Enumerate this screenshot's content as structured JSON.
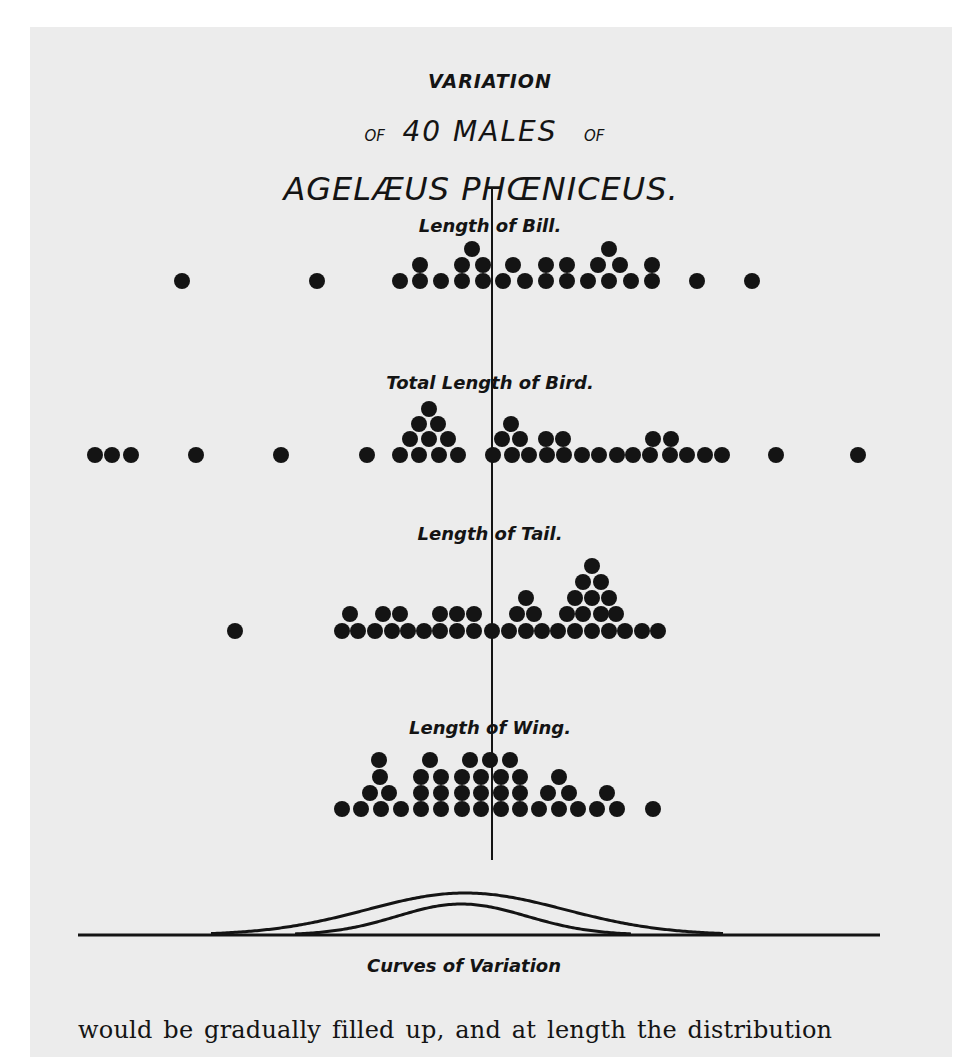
{
  "figure": {
    "title_line1": "VARIATION",
    "title_line2_prefix": "OF",
    "title_line2_main": "40 MALES",
    "title_line2_suffix": "OF",
    "title_line3": "AGELÆUS PHŒNICEUS.",
    "curves_caption": "Curves of Variation",
    "body_text": "would be gradually filled up, and at length the distribution",
    "colors": {
      "ink": "#141414",
      "paper": "#ececec",
      "background": "#ffffff"
    }
  },
  "chart_data": {
    "type": "scatter",
    "title": "Variation of 40 Males of Agelæus Phœniceus.",
    "mean_line": {
      "x": 492,
      "y_top": 188,
      "y_bottom": 860
    },
    "dot_radius": 8,
    "series": [
      {
        "name": "Length of Bill.",
        "label_pos": [
          492,
          232
        ],
        "count": 28,
        "dots": [
          [
            182,
            281
          ],
          [
            317,
            281
          ],
          [
            400,
            281
          ],
          [
            420,
            281
          ],
          [
            441,
            281
          ],
          [
            462,
            281
          ],
          [
            483,
            281
          ],
          [
            503,
            281
          ],
          [
            525,
            281
          ],
          [
            546,
            281
          ],
          [
            567,
            281
          ],
          [
            588,
            281
          ],
          [
            609,
            281
          ],
          [
            631,
            281
          ],
          [
            652,
            281
          ],
          [
            420,
            265
          ],
          [
            462,
            265
          ],
          [
            483,
            265
          ],
          [
            513,
            265
          ],
          [
            546,
            265
          ],
          [
            567,
            265
          ],
          [
            598,
            265
          ],
          [
            620,
            265
          ],
          [
            652,
            265
          ],
          [
            472,
            249
          ],
          [
            609,
            249
          ],
          [
            697,
            281
          ],
          [
            752,
            281
          ]
        ]
      },
      {
        "name": "Total Length of Bird.",
        "label_pos": [
          492,
          389
        ],
        "count": 39,
        "dots": [
          [
            95,
            455
          ],
          [
            112,
            455
          ],
          [
            131,
            455
          ],
          [
            196,
            455
          ],
          [
            281,
            455
          ],
          [
            367,
            455
          ],
          [
            400,
            455
          ],
          [
            419,
            455
          ],
          [
            439,
            455
          ],
          [
            458,
            455
          ],
          [
            410,
            439
          ],
          [
            429,
            439
          ],
          [
            448,
            439
          ],
          [
            419,
            424
          ],
          [
            438,
            424
          ],
          [
            429,
            409
          ],
          [
            493,
            455
          ],
          [
            512,
            455
          ],
          [
            529,
            455
          ],
          [
            547,
            455
          ],
          [
            564,
            455
          ],
          [
            582,
            455
          ],
          [
            599,
            455
          ],
          [
            617,
            455
          ],
          [
            633,
            455
          ],
          [
            650,
            455
          ],
          [
            670,
            455
          ],
          [
            687,
            455
          ],
          [
            705,
            455
          ],
          [
            722,
            455
          ],
          [
            502,
            439
          ],
          [
            520,
            439
          ],
          [
            546,
            439
          ],
          [
            563,
            439
          ],
          [
            653,
            439
          ],
          [
            671,
            439
          ],
          [
            511,
            424
          ],
          [
            776,
            455
          ],
          [
            858,
            455
          ]
        ]
      },
      {
        "name": "Length of Tail.",
        "label_pos": [
          492,
          540
        ],
        "count": 40,
        "dots": [
          [
            235,
            631
          ],
          [
            342,
            631
          ],
          [
            358,
            631
          ],
          [
            375,
            631
          ],
          [
            392,
            631
          ],
          [
            408,
            631
          ],
          [
            424,
            631
          ],
          [
            440,
            631
          ],
          [
            457,
            631
          ],
          [
            474,
            631
          ],
          [
            492,
            631
          ],
          [
            509,
            631
          ],
          [
            526,
            631
          ],
          [
            542,
            631
          ],
          [
            558,
            631
          ],
          [
            575,
            631
          ],
          [
            592,
            631
          ],
          [
            609,
            631
          ],
          [
            625,
            631
          ],
          [
            642,
            631
          ],
          [
            658,
            631
          ],
          [
            350,
            614
          ],
          [
            383,
            614
          ],
          [
            400,
            614
          ],
          [
            440,
            614
          ],
          [
            457,
            614
          ],
          [
            474,
            614
          ],
          [
            517,
            614
          ],
          [
            534,
            614
          ],
          [
            567,
            614
          ],
          [
            583,
            614
          ],
          [
            601,
            614
          ],
          [
            616,
            614
          ],
          [
            526,
            598
          ],
          [
            575,
            598
          ],
          [
            592,
            598
          ],
          [
            609,
            598
          ],
          [
            583,
            582
          ],
          [
            601,
            582
          ],
          [
            592,
            566
          ]
        ]
      },
      {
        "name": "Length of Wing.",
        "label_pos": [
          492,
          734
        ],
        "count": 40,
        "dots": [
          [
            342,
            809
          ],
          [
            361,
            809
          ],
          [
            381,
            809
          ],
          [
            401,
            809
          ],
          [
            421,
            809
          ],
          [
            441,
            809
          ],
          [
            462,
            809
          ],
          [
            481,
            809
          ],
          [
            501,
            809
          ],
          [
            520,
            809
          ],
          [
            539,
            809
          ],
          [
            559,
            809
          ],
          [
            578,
            809
          ],
          [
            597,
            809
          ],
          [
            617,
            809
          ],
          [
            653,
            809
          ],
          [
            370,
            793
          ],
          [
            389,
            793
          ],
          [
            421,
            793
          ],
          [
            441,
            793
          ],
          [
            462,
            793
          ],
          [
            481,
            793
          ],
          [
            501,
            793
          ],
          [
            520,
            793
          ],
          [
            548,
            793
          ],
          [
            569,
            793
          ],
          [
            607,
            793
          ],
          [
            380,
            777
          ],
          [
            421,
            777
          ],
          [
            441,
            777
          ],
          [
            462,
            777
          ],
          [
            481,
            777
          ],
          [
            501,
            777
          ],
          [
            520,
            777
          ],
          [
            559,
            777
          ],
          [
            379,
            760
          ],
          [
            430,
            760
          ],
          [
            470,
            760
          ],
          [
            490,
            760
          ],
          [
            510,
            760
          ]
        ]
      }
    ],
    "curves": {
      "baseline": {
        "x1": 78,
        "x2": 880,
        "y": 935
      },
      "outer": {
        "x_start": 211,
        "x_peak": 465,
        "x_end": 724,
        "y_peak": 893
      },
      "inner": {
        "x_start": 295,
        "x_peak": 461,
        "x_end": 632,
        "y_peak": 904
      }
    },
    "xlabel": "",
    "ylabel": ""
  }
}
